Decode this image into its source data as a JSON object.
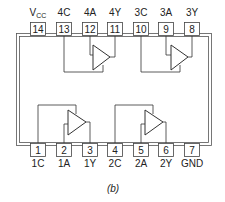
{
  "diagram": {
    "type": "ic-pinout",
    "caption": "(b)",
    "top_pins": [
      {
        "number": "14",
        "label": "VCC",
        "label_main": "V",
        "label_sub": "CC"
      },
      {
        "number": "13",
        "label": "4C"
      },
      {
        "number": "12",
        "label": "4A"
      },
      {
        "number": "11",
        "label": "4Y"
      },
      {
        "number": "10",
        "label": "3C"
      },
      {
        "number": "9",
        "label": "3A"
      },
      {
        "number": "8",
        "label": "3Y"
      }
    ],
    "bottom_pins": [
      {
        "number": "1",
        "label": "1C"
      },
      {
        "number": "2",
        "label": "1A"
      },
      {
        "number": "3",
        "label": "1Y"
      },
      {
        "number": "4",
        "label": "2C"
      },
      {
        "number": "5",
        "label": "2A"
      },
      {
        "number": "6",
        "label": "2Y"
      },
      {
        "number": "7",
        "label": "GND"
      }
    ],
    "gates": [
      {
        "id": "gate-1",
        "input": "1A",
        "output": "1Y",
        "control": "1C"
      },
      {
        "id": "gate-2",
        "input": "2A",
        "output": "2Y",
        "control": "2C"
      },
      {
        "id": "gate-3",
        "input": "3A",
        "output": "3Y",
        "control": "3C"
      },
      {
        "id": "gate-4",
        "input": "4A",
        "output": "4Y",
        "control": "4C"
      }
    ],
    "colors": {
      "line": "#333333",
      "background": "#ffffff"
    }
  }
}
